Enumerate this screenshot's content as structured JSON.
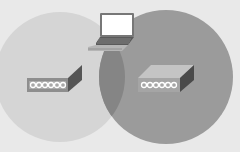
{
  "diagram": {
    "background_color": "#e9e9e9",
    "cells": [
      {
        "id": "left-cell",
        "cx": 60,
        "cy": 77,
        "r": 65,
        "color": "#d5d5d5"
      },
      {
        "id": "right-cell",
        "cx": 166,
        "cy": 77,
        "r": 67,
        "color": "#9b9b9b"
      }
    ],
    "overlap_color": "#8a8a8a",
    "access_points": [
      {
        "id": "left-access-point",
        "x": 27,
        "y": 78
      },
      {
        "id": "right-access-point",
        "x": 138,
        "y": 78
      }
    ],
    "client": {
      "id": "laptop",
      "x": 88,
      "y": 12
    }
  }
}
